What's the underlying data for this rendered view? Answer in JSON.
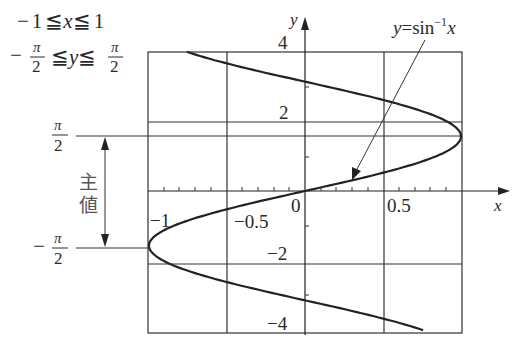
{
  "chart_data": {
    "type": "line",
    "title": "",
    "relation": "x = sin y (multi-valued inverse sine, y = sin^-1 x)",
    "curve_label": "y=sin⁻¹x",
    "xlabel": "x",
    "ylabel": "y",
    "xlim": [
      -1,
      1
    ],
    "ylim": [
      -4,
      4
    ],
    "grid": true,
    "x_grid": [
      -1,
      -0.5,
      0,
      0.5,
      1
    ],
    "y_grid": [
      -4,
      -2,
      2,
      4
    ],
    "x_tick_labels": [
      "-1",
      "-0.5",
      "0",
      "0.5"
    ],
    "y_tick_labels": [
      "4",
      "2",
      "-2",
      "-4"
    ],
    "x_minor_step": 0.1,
    "y_minor_ticks": [
      -3,
      -1,
      1,
      3
    ],
    "series": [
      {
        "name": "y=sin^-1 x",
        "x": [
          -0.757,
          -0.351,
          0.141,
          0.598,
          0.909,
          1.0,
          0.841,
          0.479,
          0.0,
          -0.479,
          -0.841,
          -1.0,
          -0.909,
          -0.598,
          -0.141,
          0.351,
          0.757
        ],
        "y": [
          4,
          3.5,
          3,
          2.5,
          2,
          1.5708,
          1,
          0.5,
          0,
          -0.5,
          -1,
          -1.5708,
          -2,
          -2.5,
          -3,
          -3.5,
          -4
        ]
      }
    ],
    "annotations": {
      "domain_range": [
        "-1 ≦ x ≦ 1",
        "-π/2 ≦ y ≦ π/2"
      ],
      "principal_value_label": "主値",
      "reference_lines": [
        {
          "label": "π/2",
          "y": 1.5708
        },
        {
          "label": "-π/2",
          "y": -1.5708
        }
      ]
    }
  },
  "labels": {
    "range_x": {
      "neg": "−",
      "one": "1",
      "le": "≦",
      "var": "x",
      "le2": "≦",
      "one2": "1"
    },
    "range_y": {
      "neg": "−",
      "pi": "π",
      "two": "2",
      "le": "≦",
      "var": "y",
      "le2": "≦",
      "pi2": "π",
      "two2": "2"
    },
    "pi": "π",
    "two": "2",
    "minus": "−",
    "principal_1": "主",
    "principal_2": "値",
    "x_axis": "x",
    "y_axis": "y",
    "tick_4": "4",
    "tick_2": "2",
    "tick_n2": "−2",
    "tick_n4": "−4",
    "tick_0": "0",
    "tick_05": "0.5",
    "tick_n05": "−0.5",
    "tick_n1": "−1",
    "curve_y": "y",
    "curve_eq": "=",
    "curve_sin": "sin",
    "curve_exp": "−1",
    "curve_x": "x"
  }
}
